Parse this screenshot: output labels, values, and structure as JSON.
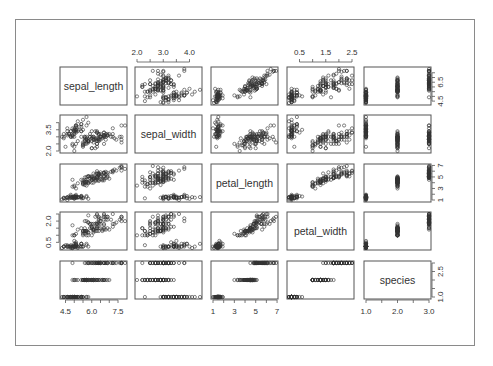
{
  "chart_data": {
    "type": "scatter",
    "subtype": "scatterplot-matrix",
    "title": "",
    "variables": [
      "sepal_length",
      "sepal_width",
      "petal_length",
      "petal_width",
      "species"
    ],
    "diagonal_labels": [
      "sepal_length",
      "sepal_width",
      "petal_length",
      "petal_width",
      "species"
    ],
    "ranges": {
      "sepal_length": [
        4.3,
        7.9
      ],
      "sepal_width": [
        2.0,
        4.4
      ],
      "petal_length": [
        1.0,
        6.9
      ],
      "petal_width": [
        0.1,
        2.5
      ],
      "species": [
        1,
        3
      ]
    },
    "axis_ticks": {
      "top": [
        {
          "col": 1,
          "labels": [
            "2.0",
            "3.0",
            "4.0"
          ],
          "values": [
            2.0,
            2.5,
            3.0,
            3.5,
            4.0
          ],
          "label_values": [
            2.0,
            3.0,
            4.0
          ]
        },
        {
          "col": 3,
          "labels": [
            "0.5",
            "1.5",
            "2.5"
          ],
          "values": [
            0.5,
            1.0,
            1.5,
            2.0,
            2.5
          ],
          "label_values": [
            0.5,
            1.5,
            2.5
          ]
        }
      ],
      "bottom": [
        {
          "col": 0,
          "labels": [
            "4.5",
            "6.0",
            "7.5"
          ],
          "values": [
            4.5,
            5.0,
            5.5,
            6.0,
            6.5,
            7.0,
            7.5
          ],
          "label_values": [
            4.5,
            6.0,
            7.5
          ]
        },
        {
          "col": 2,
          "labels": [
            "1",
            "3",
            "5",
            "7"
          ],
          "values": [
            1,
            2,
            3,
            4,
            5,
            6,
            7
          ],
          "label_values": [
            1,
            3,
            5,
            7
          ]
        },
        {
          "col": 4,
          "labels": [
            "1.0",
            "2.0",
            "3.0"
          ],
          "values": [
            1.0,
            1.5,
            2.0,
            2.5,
            3.0
          ],
          "label_values": [
            1.0,
            2.0,
            3.0
          ]
        }
      ],
      "left": [
        {
          "row": 1,
          "labels": [
            "2.0",
            "3.5"
          ],
          "values": [
            2.0,
            2.5,
            3.0,
            3.5,
            4.0
          ],
          "label_values": [
            2.0,
            3.5
          ]
        },
        {
          "row": 3,
          "labels": [
            "0.5",
            "2.0"
          ],
          "values": [
            0.5,
            1.0,
            1.5,
            2.0,
            2.5
          ],
          "label_values": [
            0.5,
            2.0
          ]
        }
      ],
      "right": [
        {
          "row": 0,
          "labels": [
            "4.5",
            "6.5"
          ],
          "values": [
            4.5,
            5.0,
            5.5,
            6.0,
            6.5,
            7.0,
            7.5
          ],
          "label_values": [
            4.5,
            6.5
          ]
        },
        {
          "row": 2,
          "labels": [
            "1",
            "3",
            "5",
            "7"
          ],
          "values": [
            1,
            2,
            3,
            4,
            5,
            6,
            7
          ],
          "label_values": [
            1,
            3,
            5,
            7
          ]
        },
        {
          "row": 4,
          "labels": [
            "1.0",
            "2.5"
          ],
          "values": [
            1.0,
            1.5,
            2.0,
            2.5,
            3.0
          ],
          "label_values": [
            1.0,
            2.5
          ]
        }
      ]
    },
    "grid": false,
    "legend": null,
    "marker": "open-circle",
    "species_codes": {
      "setosa": 1,
      "versicolor": 2,
      "virginica": 3
    },
    "points": [
      [
        5.1,
        3.5,
        1.4,
        0.2,
        1
      ],
      [
        4.9,
        3.0,
        1.4,
        0.2,
        1
      ],
      [
        4.7,
        3.2,
        1.3,
        0.2,
        1
      ],
      [
        4.6,
        3.1,
        1.5,
        0.2,
        1
      ],
      [
        5.0,
        3.6,
        1.4,
        0.2,
        1
      ],
      [
        5.4,
        3.9,
        1.7,
        0.4,
        1
      ],
      [
        4.6,
        3.4,
        1.4,
        0.3,
        1
      ],
      [
        5.0,
        3.4,
        1.5,
        0.2,
        1
      ],
      [
        4.4,
        2.9,
        1.4,
        0.2,
        1
      ],
      [
        4.9,
        3.1,
        1.5,
        0.1,
        1
      ],
      [
        5.4,
        3.7,
        1.5,
        0.2,
        1
      ],
      [
        4.8,
        3.4,
        1.6,
        0.2,
        1
      ],
      [
        4.8,
        3.0,
        1.4,
        0.1,
        1
      ],
      [
        4.3,
        3.0,
        1.1,
        0.1,
        1
      ],
      [
        5.8,
        4.0,
        1.2,
        0.2,
        1
      ],
      [
        5.7,
        4.4,
        1.5,
        0.4,
        1
      ],
      [
        5.4,
        3.9,
        1.3,
        0.4,
        1
      ],
      [
        5.1,
        3.5,
        1.4,
        0.3,
        1
      ],
      [
        5.7,
        3.8,
        1.7,
        0.3,
        1
      ],
      [
        5.1,
        3.8,
        1.5,
        0.3,
        1
      ],
      [
        5.4,
        3.4,
        1.7,
        0.2,
        1
      ],
      [
        5.1,
        3.7,
        1.5,
        0.4,
        1
      ],
      [
        4.6,
        3.6,
        1.0,
        0.2,
        1
      ],
      [
        5.1,
        3.3,
        1.7,
        0.5,
        1
      ],
      [
        4.8,
        3.4,
        1.9,
        0.2,
        1
      ],
      [
        5.0,
        3.0,
        1.6,
        0.2,
        1
      ],
      [
        5.0,
        3.4,
        1.6,
        0.4,
        1
      ],
      [
        5.2,
        3.5,
        1.5,
        0.2,
        1
      ],
      [
        5.2,
        3.4,
        1.4,
        0.2,
        1
      ],
      [
        4.7,
        3.2,
        1.6,
        0.2,
        1
      ],
      [
        4.8,
        3.1,
        1.6,
        0.2,
        1
      ],
      [
        5.4,
        3.4,
        1.5,
        0.4,
        1
      ],
      [
        5.2,
        4.1,
        1.5,
        0.1,
        1
      ],
      [
        5.5,
        4.2,
        1.4,
        0.2,
        1
      ],
      [
        4.9,
        3.1,
        1.5,
        0.2,
        1
      ],
      [
        5.0,
        3.2,
        1.2,
        0.2,
        1
      ],
      [
        5.5,
        3.5,
        1.3,
        0.2,
        1
      ],
      [
        4.9,
        3.6,
        1.4,
        0.1,
        1
      ],
      [
        4.4,
        3.0,
        1.3,
        0.2,
        1
      ],
      [
        5.1,
        3.4,
        1.5,
        0.2,
        1
      ],
      [
        5.0,
        3.5,
        1.3,
        0.3,
        1
      ],
      [
        4.5,
        2.3,
        1.3,
        0.3,
        1
      ],
      [
        4.4,
        3.2,
        1.3,
        0.2,
        1
      ],
      [
        5.0,
        3.5,
        1.6,
        0.6,
        1
      ],
      [
        5.1,
        3.8,
        1.9,
        0.4,
        1
      ],
      [
        4.8,
        3.0,
        1.4,
        0.3,
        1
      ],
      [
        5.1,
        3.8,
        1.6,
        0.2,
        1
      ],
      [
        4.6,
        3.2,
        1.4,
        0.2,
        1
      ],
      [
        5.3,
        3.7,
        1.5,
        0.2,
        1
      ],
      [
        5.0,
        3.3,
        1.4,
        0.2,
        1
      ],
      [
        7.0,
        3.2,
        4.7,
        1.4,
        2
      ],
      [
        6.4,
        3.2,
        4.5,
        1.5,
        2
      ],
      [
        6.9,
        3.1,
        4.9,
        1.5,
        2
      ],
      [
        5.5,
        2.3,
        4.0,
        1.3,
        2
      ],
      [
        6.5,
        2.8,
        4.6,
        1.5,
        2
      ],
      [
        5.7,
        2.8,
        4.5,
        1.3,
        2
      ],
      [
        6.3,
        3.3,
        4.7,
        1.6,
        2
      ],
      [
        4.9,
        2.4,
        3.3,
        1.0,
        2
      ],
      [
        6.6,
        2.9,
        4.6,
        1.3,
        2
      ],
      [
        5.2,
        2.7,
        3.9,
        1.4,
        2
      ],
      [
        5.0,
        2.0,
        3.5,
        1.0,
        2
      ],
      [
        5.9,
        3.0,
        4.2,
        1.5,
        2
      ],
      [
        6.0,
        2.2,
        4.0,
        1.0,
        2
      ],
      [
        6.1,
        2.9,
        4.7,
        1.4,
        2
      ],
      [
        5.6,
        2.9,
        3.6,
        1.3,
        2
      ],
      [
        6.7,
        3.1,
        4.4,
        1.4,
        2
      ],
      [
        5.6,
        3.0,
        4.5,
        1.5,
        2
      ],
      [
        5.8,
        2.7,
        4.1,
        1.0,
        2
      ],
      [
        6.2,
        2.2,
        4.5,
        1.5,
        2
      ],
      [
        5.6,
        2.5,
        3.9,
        1.1,
        2
      ],
      [
        5.9,
        3.2,
        4.8,
        1.8,
        2
      ],
      [
        6.1,
        2.8,
        4.0,
        1.3,
        2
      ],
      [
        6.3,
        2.5,
        4.9,
        1.5,
        2
      ],
      [
        6.1,
        2.8,
        4.7,
        1.2,
        2
      ],
      [
        6.4,
        2.9,
        4.3,
        1.3,
        2
      ],
      [
        6.6,
        3.0,
        4.4,
        1.4,
        2
      ],
      [
        6.8,
        2.8,
        4.8,
        1.4,
        2
      ],
      [
        6.7,
        3.0,
        5.0,
        1.7,
        2
      ],
      [
        6.0,
        2.9,
        4.5,
        1.5,
        2
      ],
      [
        5.7,
        2.6,
        3.5,
        1.0,
        2
      ],
      [
        5.5,
        2.4,
        3.8,
        1.1,
        2
      ],
      [
        5.5,
        2.4,
        3.7,
        1.0,
        2
      ],
      [
        5.8,
        2.7,
        3.9,
        1.2,
        2
      ],
      [
        6.0,
        2.7,
        5.1,
        1.6,
        2
      ],
      [
        5.4,
        3.0,
        4.5,
        1.5,
        2
      ],
      [
        6.0,
        3.4,
        4.5,
        1.6,
        2
      ],
      [
        6.7,
        3.1,
        4.7,
        1.5,
        2
      ],
      [
        6.3,
        2.3,
        4.4,
        1.3,
        2
      ],
      [
        5.6,
        3.0,
        4.1,
        1.3,
        2
      ],
      [
        5.5,
        2.5,
        4.0,
        1.3,
        2
      ],
      [
        5.5,
        2.6,
        4.4,
        1.2,
        2
      ],
      [
        6.1,
        3.0,
        4.6,
        1.4,
        2
      ],
      [
        5.8,
        2.6,
        4.0,
        1.2,
        2
      ],
      [
        5.0,
        2.3,
        3.3,
        1.0,
        2
      ],
      [
        5.6,
        2.7,
        4.2,
        1.3,
        2
      ],
      [
        5.7,
        3.0,
        4.2,
        1.2,
        2
      ],
      [
        5.7,
        2.9,
        4.2,
        1.3,
        2
      ],
      [
        6.2,
        2.9,
        4.3,
        1.3,
        2
      ],
      [
        5.1,
        2.5,
        3.0,
        1.1,
        2
      ],
      [
        5.7,
        2.8,
        4.1,
        1.3,
        2
      ],
      [
        6.3,
        3.3,
        6.0,
        2.5,
        3
      ],
      [
        5.8,
        2.7,
        5.1,
        1.9,
        3
      ],
      [
        7.1,
        3.0,
        5.9,
        2.1,
        3
      ],
      [
        6.3,
        2.9,
        5.6,
        1.8,
        3
      ],
      [
        6.5,
        3.0,
        5.8,
        2.2,
        3
      ],
      [
        7.6,
        3.0,
        6.6,
        2.1,
        3
      ],
      [
        4.9,
        2.5,
        4.5,
        1.7,
        3
      ],
      [
        7.3,
        2.9,
        6.3,
        1.8,
        3
      ],
      [
        6.7,
        2.5,
        5.8,
        1.8,
        3
      ],
      [
        7.2,
        3.6,
        6.1,
        2.5,
        3
      ],
      [
        6.5,
        3.2,
        5.1,
        2.0,
        3
      ],
      [
        6.4,
        2.7,
        5.3,
        1.9,
        3
      ],
      [
        6.8,
        3.0,
        5.5,
        2.1,
        3
      ],
      [
        5.7,
        2.5,
        5.0,
        2.0,
        3
      ],
      [
        5.8,
        2.8,
        5.1,
        2.4,
        3
      ],
      [
        6.4,
        3.2,
        5.3,
        2.3,
        3
      ],
      [
        6.5,
        3.0,
        5.5,
        1.8,
        3
      ],
      [
        7.7,
        3.8,
        6.7,
        2.2,
        3
      ],
      [
        7.7,
        2.6,
        6.9,
        2.3,
        3
      ],
      [
        6.0,
        2.2,
        5.0,
        1.5,
        3
      ],
      [
        6.9,
        3.2,
        5.7,
        2.3,
        3
      ],
      [
        5.6,
        2.8,
        4.9,
        2.0,
        3
      ],
      [
        7.7,
        2.8,
        6.7,
        2.0,
        3
      ],
      [
        6.3,
        2.7,
        4.9,
        1.8,
        3
      ],
      [
        6.7,
        3.3,
        5.7,
        2.1,
        3
      ],
      [
        7.2,
        3.2,
        6.0,
        1.8,
        3
      ],
      [
        6.2,
        2.8,
        4.8,
        1.8,
        3
      ],
      [
        6.1,
        3.0,
        4.9,
        1.8,
        3
      ],
      [
        6.4,
        2.8,
        5.6,
        2.1,
        3
      ],
      [
        7.2,
        3.0,
        5.8,
        1.6,
        3
      ],
      [
        7.4,
        2.8,
        6.1,
        1.9,
        3
      ],
      [
        7.9,
        3.8,
        6.4,
        2.0,
        3
      ],
      [
        6.4,
        2.8,
        5.6,
        2.2,
        3
      ],
      [
        6.3,
        2.8,
        5.1,
        1.5,
        3
      ],
      [
        6.1,
        2.6,
        5.6,
        1.4,
        3
      ],
      [
        7.7,
        3.0,
        6.1,
        2.3,
        3
      ],
      [
        6.3,
        3.4,
        5.6,
        2.4,
        3
      ],
      [
        6.4,
        3.1,
        5.5,
        1.8,
        3
      ],
      [
        6.0,
        3.0,
        4.8,
        1.8,
        3
      ],
      [
        6.9,
        3.1,
        5.4,
        2.1,
        3
      ],
      [
        6.7,
        3.1,
        5.6,
        2.4,
        3
      ],
      [
        6.9,
        3.1,
        5.1,
        2.3,
        3
      ],
      [
        5.8,
        2.7,
        5.1,
        1.9,
        3
      ],
      [
        6.8,
        3.2,
        5.9,
        2.3,
        3
      ],
      [
        6.7,
        3.3,
        5.7,
        2.5,
        3
      ],
      [
        6.7,
        3.0,
        5.2,
        2.3,
        3
      ],
      [
        6.3,
        2.5,
        5.0,
        1.9,
        3
      ],
      [
        6.5,
        3.0,
        5.2,
        2.0,
        3
      ],
      [
        6.2,
        3.4,
        5.4,
        2.3,
        3
      ],
      [
        5.9,
        3.0,
        5.1,
        1.8,
        3
      ]
    ]
  },
  "layout": {
    "col_x": [
      60,
      135,
      211,
      287,
      364
    ],
    "row_y": [
      67,
      115,
      164,
      212,
      261
    ],
    "panel_w": 67,
    "panel_h": 38,
    "colors": {
      "axis": "#555555",
      "point": "#333333",
      "label": "#333333",
      "frame": "#8a8a8a"
    }
  }
}
